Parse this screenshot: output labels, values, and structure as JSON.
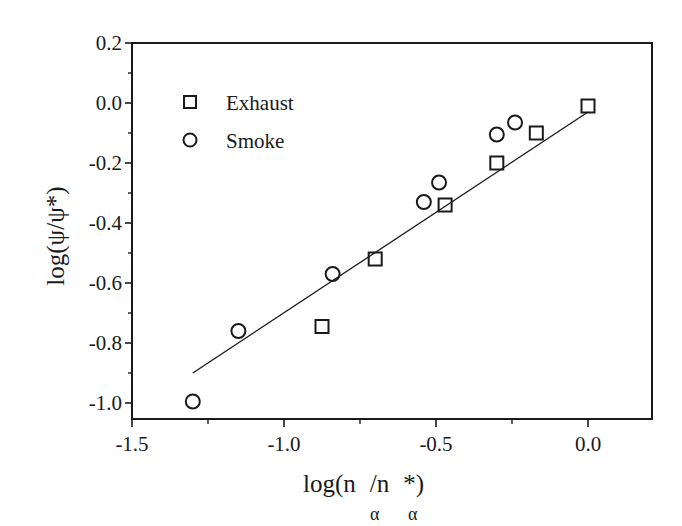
{
  "chart_data": {
    "type": "scatter",
    "title": "",
    "xlabel": "log(n_α/n_α*)",
    "ylabel": "log(ψ/ψ*)",
    "xlim": [
      -1.5,
      0.21
    ],
    "ylim": [
      -1.05,
      0.2
    ],
    "x_ticks": [
      -1.5,
      -1.0,
      -0.5,
      0.0
    ],
    "x_tick_labels": [
      "-1.5",
      "-1.0",
      "-0.5",
      "0.0"
    ],
    "x_minor_ticks": [
      -1.25,
      -0.75,
      -0.25
    ],
    "y_ticks": [
      0.2,
      0.0,
      -0.2,
      -0.4,
      -0.6,
      -0.8,
      -1.0
    ],
    "y_tick_labels": [
      "0.2",
      "0.0",
      "-0.2",
      "-0.4",
      "-0.6",
      "-0.8",
      "-1.0"
    ],
    "y_minor_ticks": [
      0.1,
      -0.1,
      -0.3,
      -0.5,
      -0.7,
      -0.9
    ],
    "grid": false,
    "legend_position": "upper-left",
    "series": [
      {
        "name": "Exhaust",
        "marker": "square",
        "points": [
          {
            "x": -0.875,
            "y": -0.745
          },
          {
            "x": -0.7,
            "y": -0.52
          },
          {
            "x": -0.47,
            "y": -0.34
          },
          {
            "x": -0.3,
            "y": -0.2
          },
          {
            "x": -0.17,
            "y": -0.1
          },
          {
            "x": 0.0,
            "y": -0.01
          }
        ]
      },
      {
        "name": "Smoke",
        "marker": "circle",
        "points": [
          {
            "x": -1.3,
            "y": -0.995
          },
          {
            "x": -1.15,
            "y": -0.76
          },
          {
            "x": -0.84,
            "y": -0.57
          },
          {
            "x": -0.54,
            "y": -0.33
          },
          {
            "x": -0.49,
            "y": -0.265
          },
          {
            "x": -0.3,
            "y": -0.105
          },
          {
            "x": -0.24,
            "y": -0.065
          }
        ]
      },
      {
        "name": "Linear fit",
        "type": "line",
        "points": [
          {
            "x": -1.3,
            "y": -0.9
          },
          {
            "x": 0.0,
            "y": -0.03
          }
        ]
      }
    ]
  },
  "legend": {
    "items": [
      {
        "label": "Exhaust",
        "marker": "square-icon"
      },
      {
        "label": "Smoke",
        "marker": "circle-icon"
      }
    ]
  },
  "axes": {
    "x_title_main": "log(n",
    "x_title_mid": "/n",
    "x_title_end": "*)",
    "x_title_sub": "α",
    "y_title": "log(ψ/ψ*)"
  },
  "colors": {
    "ink": "#1a1a1a",
    "background": "#ffffff"
  }
}
